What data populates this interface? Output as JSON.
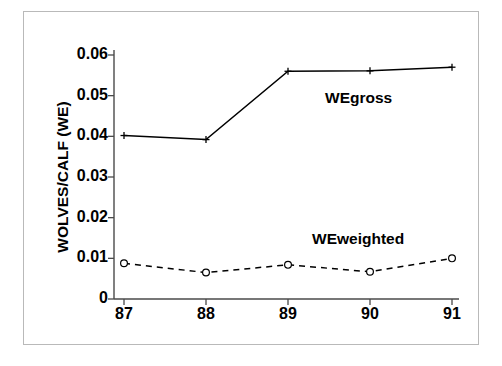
{
  "chart_data": {
    "type": "line",
    "title": "",
    "subtitle": "",
    "xlabel": "",
    "ylabel": "WOLVES/CALF (WE)",
    "x": [
      87,
      88,
      89,
      90,
      91
    ],
    "categories": [
      "87",
      "88",
      "89",
      "90",
      "91"
    ],
    "xtick_labels": [
      "87",
      "88",
      "89",
      "90",
      "91"
    ],
    "ytick_labels": [
      "0",
      "0.01",
      "0.02",
      "0.03",
      "0.04",
      "0.05",
      "0.06"
    ],
    "ytick_values": [
      0,
      0.01,
      0.02,
      0.03,
      0.04,
      0.05,
      0.06
    ],
    "ylim": [
      0,
      0.062
    ],
    "xlim": [
      86.6,
      91.4
    ],
    "grid": false,
    "legend": "inline-annotations",
    "series": [
      {
        "name": "WEgross",
        "values": [
          0.0402,
          0.0392,
          0.056,
          0.0561,
          0.057
        ],
        "line_style": "solid",
        "marker": "plus",
        "marker_fill": "none",
        "color": "#000000",
        "annotation": "WEgross"
      },
      {
        "name": "WEweighted",
        "values": [
          0.0088,
          0.0065,
          0.0084,
          0.0067,
          0.01
        ],
        "line_style": "dashed",
        "marker": "circle-open",
        "marker_fill": "#ffffff",
        "color": "#000000",
        "annotation": "WEweighted"
      }
    ],
    "annotations": [
      {
        "text": "WEgross",
        "x": 89.8,
        "y": 0.0465
      },
      {
        "text": "WEweighted",
        "x": 89.7,
        "y": 0.0175
      }
    ],
    "colors": {
      "axis": "#4a4a4a",
      "series": "#000000",
      "frame": "#b9b9b9",
      "background": "#ffffff"
    }
  }
}
